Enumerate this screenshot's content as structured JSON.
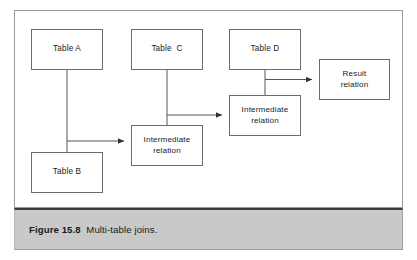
{
  "figure": {
    "caption_number": "Figure 15.8",
    "caption_title": "Multi-table joins.",
    "caption_separator": "  ",
    "frame_border_color": "#9a9a9a",
    "caption_bar_color": "#c9c9c9",
    "caption_rule_color": "#3a3a3a",
    "background_color": "#ffffff"
  },
  "diagram": {
    "type": "flow-diagram",
    "line_color": "#555555",
    "box_border_color": "#6d6d6d",
    "box_fill_color": "#ffffff",
    "nodes": [
      {
        "id": "table-a",
        "label": "Table A",
        "x": 31,
        "y": 29,
        "w": 72,
        "h": 41
      },
      {
        "id": "table-c",
        "label": "Table  C",
        "x": 131,
        "y": 29,
        "w": 72,
        "h": 41
      },
      {
        "id": "table-d",
        "label": "Table D",
        "x": 229,
        "y": 29,
        "w": 72,
        "h": 41
      },
      {
        "id": "result-relation",
        "label": "Result\nrelation",
        "x": 319,
        "y": 59,
        "w": 71,
        "h": 41
      },
      {
        "id": "intermediate-2",
        "label": "Intermediate\nrelation",
        "x": 229,
        "y": 95,
        "w": 72,
        "h": 41
      },
      {
        "id": "intermediate-1",
        "label": "Intermediate\nrelation",
        "x": 131,
        "y": 125,
        "w": 72,
        "h": 41
      },
      {
        "id": "table-b",
        "label": "Table B",
        "x": 31,
        "y": 152,
        "w": 72,
        "h": 41
      }
    ],
    "edges": [
      {
        "id": "edge-a-to-intermediate-1",
        "from": "table-a",
        "to": "intermediate-1",
        "arrow": true
      },
      {
        "id": "edge-b-to-intermediate-1",
        "from": "table-b",
        "to": "intermediate-1",
        "arrow": true
      },
      {
        "id": "edge-c-to-intermediate-2",
        "from": "table-c",
        "to": "intermediate-2",
        "arrow": true
      },
      {
        "id": "edge-i1-to-intermediate-2",
        "from": "intermediate-1",
        "to": "intermediate-2",
        "arrow": true
      },
      {
        "id": "edge-d-to-result",
        "from": "table-d",
        "to": "result-relation",
        "arrow": true
      },
      {
        "id": "edge-i2-to-result",
        "from": "intermediate-2",
        "to": "result-relation",
        "arrow": true
      }
    ]
  }
}
